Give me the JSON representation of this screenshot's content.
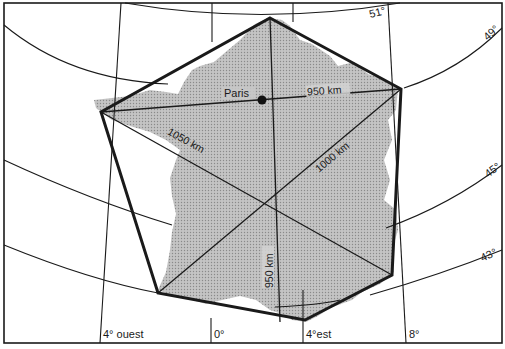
{
  "map": {
    "subject": "France hexagon",
    "colors": {
      "land_fill": "#b9b9b9",
      "line": "#1a1a1a",
      "background": "#ffffff"
    },
    "city": {
      "name": "Paris",
      "marker": "filled-dot"
    },
    "distances": [
      {
        "id": "west-east",
        "label": "950 km"
      },
      {
        "id": "nw-se",
        "label": "1050 km"
      },
      {
        "id": "sw-ne",
        "label": "1000 km"
      },
      {
        "id": "north-south",
        "label": "950 km"
      }
    ],
    "parallels": [
      {
        "label": "51°"
      },
      {
        "label": "49°"
      },
      {
        "label": "45°"
      },
      {
        "label": "43°"
      }
    ],
    "meridians": [
      {
        "label": "4° ouest"
      },
      {
        "label": "0°"
      },
      {
        "label": "4°est"
      },
      {
        "label": "8°"
      }
    ]
  }
}
